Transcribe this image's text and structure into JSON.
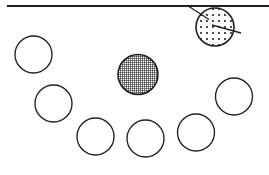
{
  "figure": {
    "canvas": {
      "width": 269,
      "height": 175,
      "background": "#ffffff"
    },
    "ink_color": "#231f20",
    "rule": {
      "name": "horizontal-rule",
      "x1": 7,
      "y1": 6,
      "x2": 269,
      "y2": 6,
      "thickness": 2.1
    },
    "circles": [
      {
        "id": "circle-upper-left",
        "cx": 33.5,
        "cy": 54.5,
        "r": 18.5,
        "fill": "none"
      },
      {
        "id": "circle-mid-left",
        "cx": 53.5,
        "cy": 103.5,
        "r": 18.5,
        "fill": "none"
      },
      {
        "id": "circle-bottom-left",
        "cx": 95.5,
        "cy": 136.5,
        "r": 18.5,
        "fill": "none"
      },
      {
        "id": "circle-bottom-mid",
        "cx": 145.5,
        "cy": 138.5,
        "r": 18.5,
        "fill": "none"
      },
      {
        "id": "circle-bottom-right",
        "cx": 196.0,
        "cy": 132.5,
        "r": 18.5,
        "fill": "none"
      },
      {
        "id": "circle-mid-right",
        "cx": 234.0,
        "cy": 96.5,
        "r": 18.5,
        "fill": "none"
      },
      {
        "id": "circle-center-hatched",
        "cx": 138.0,
        "cy": 74.5,
        "r": 20.0,
        "fill": "crosshatch"
      },
      {
        "id": "circle-top-right-stippled",
        "cx": 215.0,
        "cy": 27.0,
        "r": 19.0,
        "fill": "stipple"
      }
    ],
    "leaders": [
      {
        "id": "leader-upper-left",
        "x1": 187.5,
        "y1": 5.5,
        "x2": 209.0,
        "y2": 19.5
      },
      {
        "id": "leader-lower-right",
        "x1": 212.0,
        "y1": 25.0,
        "x2": 241.0,
        "y2": 33.0
      }
    ],
    "fills": {
      "crosshatch": {
        "name": "dense-crosshatch-pattern",
        "base_color": "#ffffff",
        "line_color": "#1a1a1a",
        "spacing": 2,
        "line_width": 1.1
      },
      "stipple": {
        "name": "dot-stipple-pattern",
        "base_color": "#ffffff",
        "dot_color": "#231f20",
        "spacing": 6,
        "dot_radius": 1.05
      }
    }
  }
}
